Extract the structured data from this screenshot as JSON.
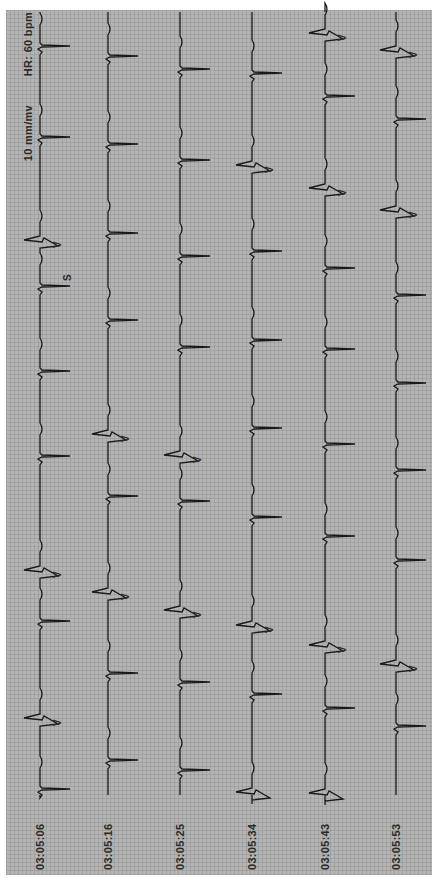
{
  "header": {
    "heart_rate": "HR: 60 bpm",
    "gain": "10 mm/mv"
  },
  "colors": {
    "paper": "#b4b4b4",
    "grid": "#969696",
    "trace": "#1a1a1a",
    "text": "#2a2a2a"
  },
  "strips": [
    {
      "timestamp": "03:05:06",
      "x": 40,
      "beats": [
        {
          "y": 45,
          "type": "N"
        },
        {
          "y": 136,
          "type": "N"
        },
        {
          "y": 242,
          "type": "V",
          "label": "V"
        },
        {
          "y": 285,
          "type": "S",
          "label": "S"
        },
        {
          "y": 370,
          "type": "N"
        },
        {
          "y": 455,
          "type": "N"
        },
        {
          "y": 572,
          "type": "V",
          "label": "V"
        },
        {
          "y": 620,
          "type": "N"
        },
        {
          "y": 720,
          "type": "V",
          "label": "V"
        },
        {
          "y": 788,
          "type": "N"
        }
      ]
    },
    {
      "timestamp": "03:05:16",
      "x": 108,
      "beats": [
        {
          "y": 55,
          "type": "N"
        },
        {
          "y": 143,
          "type": "N"
        },
        {
          "y": 232,
          "type": "N"
        },
        {
          "y": 319,
          "type": "N"
        },
        {
          "y": 436,
          "type": "V",
          "label": "V"
        },
        {
          "y": 495,
          "type": "N"
        },
        {
          "y": 594,
          "type": "V",
          "label": "V"
        },
        {
          "y": 672,
          "type": "N"
        },
        {
          "y": 759,
          "type": "N"
        }
      ]
    },
    {
      "timestamp": "03:05:25",
      "x": 180,
      "beats": [
        {
          "y": 68,
          "type": "N"
        },
        {
          "y": 159,
          "type": "N"
        },
        {
          "y": 255,
          "type": "N"
        },
        {
          "y": 346,
          "type": "N"
        },
        {
          "y": 457,
          "type": "V",
          "label": "V"
        },
        {
          "y": 500,
          "type": "N"
        },
        {
          "y": 612,
          "type": "V",
          "label": "V"
        },
        {
          "y": 681,
          "type": "N"
        },
        {
          "y": 769,
          "type": "N"
        }
      ]
    },
    {
      "timestamp": "03:05:34",
      "x": 252,
      "beats": [
        {
          "y": 72,
          "type": "N"
        },
        {
          "y": 167,
          "type": "V",
          "label": "V"
        },
        {
          "y": 250,
          "type": "N"
        },
        {
          "y": 339,
          "type": "N"
        },
        {
          "y": 427,
          "type": "N"
        },
        {
          "y": 516,
          "type": "N"
        },
        {
          "y": 627,
          "type": "V",
          "label": "V"
        },
        {
          "y": 693,
          "type": "N"
        },
        {
          "y": 794,
          "type": "V"
        }
      ]
    },
    {
      "timestamp": "03:05:43",
      "x": 325,
      "beats": [
        {
          "y": 35,
          "type": "V",
          "label": "V"
        },
        {
          "y": 95,
          "type": "N"
        },
        {
          "y": 190,
          "type": "V",
          "label": "V"
        },
        {
          "y": 267,
          "type": "N"
        },
        {
          "y": 348,
          "type": "N"
        },
        {
          "y": 443,
          "type": "N"
        },
        {
          "y": 535,
          "type": "N"
        },
        {
          "y": 647,
          "type": "V",
          "label": "V"
        },
        {
          "y": 707,
          "type": "N"
        },
        {
          "y": 795,
          "type": "V"
        }
      ]
    },
    {
      "timestamp": "03:05:53",
      "x": 396,
      "beats": [
        {
          "y": 52,
          "type": "V",
          "label": "V"
        },
        {
          "y": 118,
          "type": "N"
        },
        {
          "y": 212,
          "type": "V",
          "label": "V"
        },
        {
          "y": 294,
          "type": "N"
        },
        {
          "y": 382,
          "type": "N"
        },
        {
          "y": 469,
          "type": "N"
        },
        {
          "y": 559,
          "type": "N"
        },
        {
          "y": 666,
          "type": "V",
          "label": "V"
        },
        {
          "y": 725,
          "type": "N"
        }
      ]
    }
  ]
}
